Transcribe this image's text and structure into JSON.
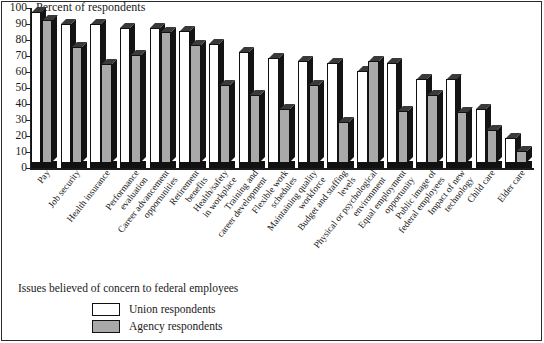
{
  "figure": {
    "axis_title": "Percent of respondents",
    "legend_title": "Issues believed of concern to federal employees",
    "colors": {
      "union": "#ffffff",
      "agency": "#a9a9a9",
      "ink": "#141414"
    }
  },
  "legend": {
    "entries": [
      {
        "key": "union",
        "label": "Union respondents"
      },
      {
        "key": "agency",
        "label": "Agency respondents"
      }
    ]
  },
  "chart_data": {
    "type": "bar",
    "title": "Issues believed of concern to federal employees",
    "subtitle": "",
    "xlabel": "",
    "ylabel": "Percent of respondents",
    "ylim": [
      0,
      100
    ],
    "yticks": [
      0,
      10,
      20,
      30,
      40,
      50,
      60,
      70,
      80,
      90,
      100
    ],
    "grid": false,
    "legend_position": "below-left",
    "categories": [
      "Pay",
      "Job security",
      "Health insurance",
      "Performance evaluation",
      "Career advancement opportunities",
      "Retirement benefits",
      "Health/safety in workplace",
      "Training and career development",
      "Flexible work schedules",
      "Maintaining quality workforce",
      "Budget and staffing levels",
      "Physical or psychological environment",
      "Equal employment opportunity",
      "Public image of federal employees",
      "Impact of new technology",
      "Child care",
      "Elder care"
    ],
    "category_lines": [
      [
        "Pay"
      ],
      [
        "Job security"
      ],
      [
        "Health insurance"
      ],
      [
        "Performance",
        "evaluation"
      ],
      [
        "Career advancement",
        "opportunities"
      ],
      [
        "Retirement",
        "benefits"
      ],
      [
        "Health/safety",
        "in workplace"
      ],
      [
        "Training and",
        "career development"
      ],
      [
        "Flexible work",
        "schedules"
      ],
      [
        "Maintaining quality",
        "workforce"
      ],
      [
        "Budget and staffing",
        "levels"
      ],
      [
        "Physical or psychological",
        "environment"
      ],
      [
        "Equal employment",
        "opportunity"
      ],
      [
        "Public image of",
        "federal employees"
      ],
      [
        "Impact of new",
        "technology"
      ],
      [
        "Child care"
      ],
      [
        "Elder care"
      ]
    ],
    "series": [
      {
        "name": "Union respondents",
        "key": "union",
        "color": "#ffffff",
        "values": [
          94,
          86,
          86,
          84,
          84,
          82,
          74,
          69,
          65,
          63,
          62,
          57,
          62,
          52,
          52,
          33,
          15
        ]
      },
      {
        "name": "Agency respondents",
        "key": "agency",
        "color": "#a9a9a9",
        "values": [
          89,
          72,
          61,
          67,
          81,
          73,
          48,
          42,
          33,
          48,
          25,
          63,
          32,
          42,
          31,
          20,
          7
        ]
      }
    ]
  }
}
